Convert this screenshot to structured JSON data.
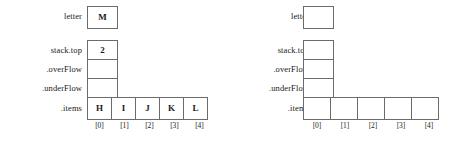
{
  "diagram": {
    "type": "stack-object-state",
    "labels": {
      "letter": "letter",
      "stack_top": "stack.top",
      "over_flow": ".overFlow",
      "under_flow": ".underFlow",
      "items": ".items"
    },
    "indices": [
      "[0]",
      "[1]",
      "[2]",
      "[3]",
      "[4]"
    ],
    "panels": [
      {
        "name": "filled-state",
        "letter_value": "M",
        "stack_top_value": "2",
        "over_flow_value": "",
        "under_flow_value": "",
        "items_values": [
          "H",
          "I",
          "J",
          "K",
          "L"
        ]
      },
      {
        "name": "empty-state",
        "letter_value": "",
        "stack_top_value": "",
        "over_flow_value": "",
        "under_flow_value": "",
        "items_values": [
          "",
          "",
          "",
          "",
          ""
        ]
      }
    ]
  },
  "colors": {
    "background": "#ffffff",
    "box_border": "#6b6b6b",
    "text": "#1a1a1a"
  }
}
